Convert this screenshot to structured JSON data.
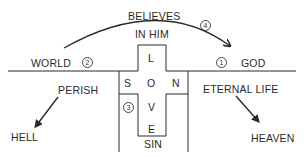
{
  "diagram": {
    "labels": {
      "believes": "BELIEVES",
      "in_him": "IN HIM",
      "world": "WORLD",
      "god": "GOD",
      "perish": "PERISH",
      "hell": "HELL",
      "eternal_life": "ETERNAL LIFE",
      "heaven": "HEAVEN",
      "sin": "SIN"
    },
    "cross_letters": {
      "l": "L",
      "o": "O",
      "v": "V",
      "e": "E",
      "s": "S",
      "n": "N"
    },
    "step_numbers": {
      "one": "1",
      "two": "2",
      "three": "3",
      "four": "4"
    },
    "colors": {
      "line": "#2a2a2a",
      "text": "#2a2a2a",
      "background": "#ffffff"
    }
  }
}
